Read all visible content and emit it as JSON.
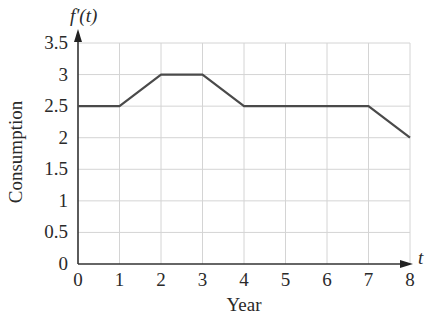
{
  "chart_data": {
    "type": "line",
    "title": "",
    "y_axis_title": "f'(t)",
    "x_axis_variable": "t",
    "xlabel": "Year",
    "ylabel": "Consumption",
    "x": [
      0,
      1,
      2,
      3,
      4,
      5,
      6,
      7,
      8
    ],
    "series": [
      {
        "name": "f'(t)",
        "values": [
          2.5,
          2.5,
          3,
          3,
          2.5,
          2.5,
          2.5,
          2.5,
          2
        ]
      }
    ],
    "x_ticks": [
      "0",
      "1",
      "2",
      "3",
      "4",
      "5",
      "6",
      "7",
      "8"
    ],
    "y_ticks": [
      "0",
      "0.5",
      "1",
      "1.5",
      "2",
      "2.5",
      "3",
      "3.5"
    ],
    "xlim": [
      0,
      8
    ],
    "ylim": [
      0,
      3.5
    ],
    "grid": true,
    "legend": "none"
  },
  "colors": {
    "line": "#4a4a4a",
    "grid": "#d4d4d4",
    "axis": "#333333",
    "text": "#2a2a2a"
  }
}
